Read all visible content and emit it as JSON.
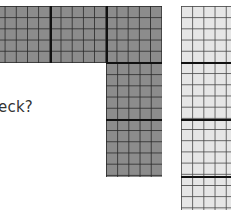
{
  "figure": {
    "question_fragment": "eck?",
    "shaded_shape": {
      "description": "L-shaped arrangement of hundred-style grid blocks (5x5 cells each)",
      "fill_color": "#8c8c8c",
      "blocks": [
        {
          "row": 0,
          "col": 0
        },
        {
          "row": 0,
          "col": 1
        },
        {
          "row": 0,
          "col": 2
        },
        {
          "row": 1,
          "col": 2
        },
        {
          "row": 2,
          "col": 2
        }
      ]
    },
    "unshaded_strip": {
      "description": "Vertical strip of light grid blocks",
      "fill_color": "#e6e6e6",
      "blocks_visible": 4
    }
  }
}
